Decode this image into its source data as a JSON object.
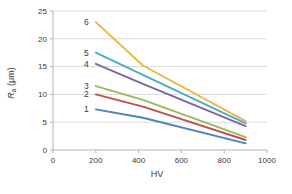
{
  "chart_data": {
    "type": "line",
    "x": [
      200,
      420,
      900
    ],
    "series": [
      {
        "name": "1",
        "color": "#4F81BD",
        "values": [
          7.3,
          5.8,
          1.2
        ]
      },
      {
        "name": "2",
        "color": "#C0504D",
        "values": [
          10.0,
          7.8,
          1.8
        ]
      },
      {
        "name": "3",
        "color": "#9BBB59",
        "values": [
          11.5,
          9.0,
          2.3
        ]
      },
      {
        "name": "4",
        "color": "#8064A2",
        "values": [
          15.5,
          11.9,
          4.3
        ]
      },
      {
        "name": "5",
        "color": "#4BACC6",
        "values": [
          17.5,
          13.5,
          4.8
        ]
      },
      {
        "name": "6",
        "color": "#ECB73F",
        "values": [
          23.0,
          15.2,
          5.2
        ]
      }
    ],
    "title": "",
    "xlabel": "HV",
    "ylabel": "Ra (μm)",
    "ylabel_parts": {
      "main": "R",
      "sub": "a",
      "rest": " (μm)"
    },
    "xlim": [
      0,
      1000
    ],
    "ylim": [
      0,
      25
    ],
    "xticks": [
      0,
      200,
      400,
      600,
      800,
      1000
    ],
    "yticks": [
      0,
      5,
      10,
      15,
      20,
      25
    ],
    "grid": "horizontal",
    "legend": "series numbers labeled inline at left ends of lines",
    "series_label_color": "#3a3a3a"
  },
  "style": {
    "grid_color": "#d9d9d9",
    "axis_color": "#b3b3b3",
    "tick_text_color": "#3a3a3a",
    "background": "#ffffff"
  }
}
